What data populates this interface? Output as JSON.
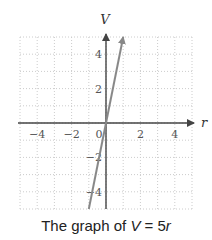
{
  "chart_data": {
    "type": "line",
    "title": "The graph of V = 5r",
    "equation": "V = 5r",
    "xlabel": "r",
    "ylabel": "V",
    "xlim": [
      -5,
      5
    ],
    "ylim": [
      -5,
      5
    ],
    "xticks": [
      -4,
      -2,
      0,
      2,
      4
    ],
    "yticks": [
      -4,
      -2,
      2,
      4
    ],
    "grid": true,
    "series": [
      {
        "name": "V = 5r",
        "x": [
          -1,
          0,
          1
        ],
        "y": [
          -5,
          0,
          5
        ],
        "color": "#888888"
      }
    ]
  },
  "caption": {
    "prefix": "The graph of ",
    "var_v": "V",
    "equals": " = 5",
    "var_r": "r"
  },
  "colors": {
    "axis": "#444444",
    "grid": "#cccccc",
    "line": "#888888"
  }
}
